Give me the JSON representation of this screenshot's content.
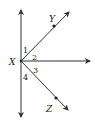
{
  "diagram": {
    "type": "geometry-angles",
    "vertex": {
      "label": "X"
    },
    "points": [
      {
        "label": "Y"
      },
      {
        "label": "Z"
      }
    ],
    "angles": [
      {
        "label": "1"
      },
      {
        "label": "2"
      },
      {
        "label": "3"
      },
      {
        "label": "4"
      }
    ],
    "colors": {
      "line": "#333333",
      "text": "#222222"
    }
  }
}
